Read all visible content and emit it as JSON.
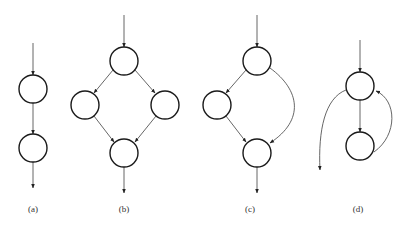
{
  "diagram": {
    "type": "control-flow-graphs",
    "node_radius": 14,
    "colors": {
      "node_stroke": "#1a1a1a",
      "edge": "#555555",
      "label": "#333333",
      "background": "#ffffff"
    },
    "panels": [
      {
        "id": "a",
        "label": "(a)",
        "label_pos": [
          33,
          212
        ],
        "nodes": [
          {
            "id": "a1",
            "x": 33,
            "y": 89
          },
          {
            "id": "a2",
            "x": 33,
            "y": 148
          }
        ],
        "edges": [
          {
            "d": "M33 43 L33 75"
          },
          {
            "d": "M33 103 L33 134"
          },
          {
            "d": "M33 162 L33 188"
          }
        ]
      },
      {
        "id": "b",
        "label": "(b)",
        "label_pos": [
          124,
          212
        ],
        "nodes": [
          {
            "id": "b1",
            "x": 124,
            "y": 61
          },
          {
            "id": "b2",
            "x": 85,
            "y": 105
          },
          {
            "id": "b3",
            "x": 165,
            "y": 105
          },
          {
            "id": "b4",
            "x": 124,
            "y": 153
          }
        ],
        "edges": [
          {
            "d": "M124 15 L124 47"
          },
          {
            "d": "M113 70 L94 93"
          },
          {
            "d": "M135 70 L155 93"
          },
          {
            "d": "M94 116 L114 142"
          },
          {
            "d": "M156 116 L135 142"
          },
          {
            "d": "M124 167 L124 193"
          }
        ]
      },
      {
        "id": "c",
        "label": "(c)",
        "label_pos": [
          250,
          212
        ],
        "nodes": [
          {
            "id": "c1",
            "x": 257,
            "y": 61
          },
          {
            "id": "c2",
            "x": 217,
            "y": 105
          },
          {
            "id": "c3",
            "x": 257,
            "y": 153
          }
        ],
        "edges": [
          {
            "d": "M257 15 L257 47"
          },
          {
            "d": "M246 70 L226 93"
          },
          {
            "d": "M226 116 L246 142"
          },
          {
            "d": "M270 68 C300 90 305 120 270 143"
          },
          {
            "d": "M257 167 L257 193"
          }
        ]
      },
      {
        "id": "d",
        "label": "(d)",
        "label_pos": [
          358,
          212
        ],
        "nodes": [
          {
            "id": "d1",
            "x": 360,
            "y": 86
          },
          {
            "id": "d2",
            "x": 360,
            "y": 146
          }
        ],
        "edges": [
          {
            "d": "M360 40 L360 72"
          },
          {
            "d": "M360 100 L360 132"
          },
          {
            "d": "M346 90 C325 98 318 130 320 170"
          },
          {
            "d": "M374 152 C398 135 397 100 376 91"
          }
        ]
      }
    ]
  }
}
